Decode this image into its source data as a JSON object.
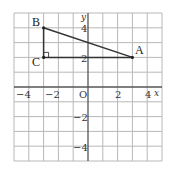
{
  "diagram": {
    "type": "coordinate-grid",
    "axes": {
      "x_label": "x",
      "y_label": "y",
      "origin_label": "O",
      "x_ticks": [
        {
          "value": -4,
          "label": "−4"
        },
        {
          "value": -2,
          "label": "−2"
        },
        {
          "value": 2,
          "label": "2"
        },
        {
          "value": 4,
          "label": "4"
        }
      ],
      "y_ticks": [
        {
          "value": 4,
          "label": "4"
        },
        {
          "value": 2,
          "label": "2"
        },
        {
          "value": -2,
          "label": "−2"
        },
        {
          "value": -4,
          "label": "−4"
        }
      ],
      "range": {
        "x": [
          -5,
          5
        ],
        "y": [
          -5,
          5
        ]
      }
    },
    "points": [
      {
        "name": "A",
        "x": 3,
        "y": 2
      },
      {
        "name": "B",
        "x": -3,
        "y": 4
      },
      {
        "name": "C",
        "x": -3,
        "y": 2
      }
    ],
    "triangle": [
      "A",
      "B",
      "C"
    ],
    "right_angle_at": "C",
    "colors": {
      "grid": "#b8b8b8",
      "axis": "#555555",
      "triangle": "#333333"
    }
  }
}
